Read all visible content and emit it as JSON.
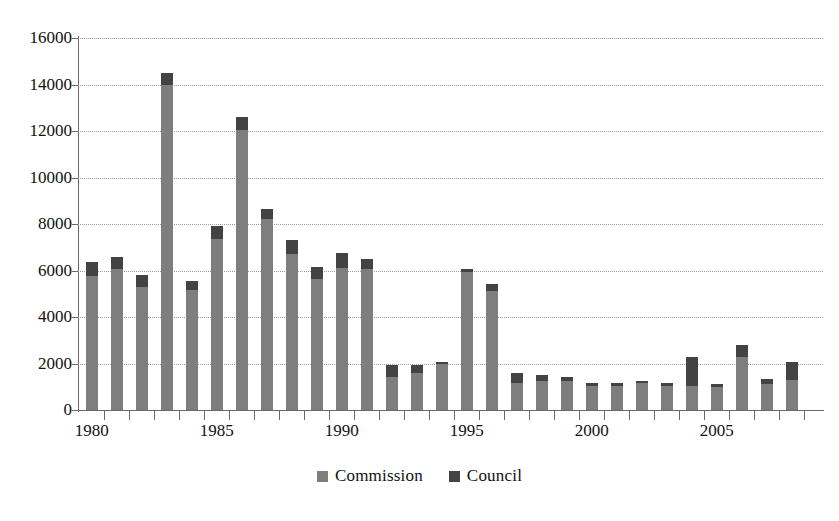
{
  "chart_data": {
    "type": "bar",
    "subtype": "stacked-vertical",
    "title": "",
    "subtitle": "",
    "xlabel": "",
    "ylabel": "",
    "ylim": [
      0,
      16000
    ],
    "ytick_step": 2000,
    "ytick_labels": [
      "0",
      "2000",
      "4000",
      "6000",
      "8000",
      "10000",
      "12000",
      "14000",
      "16000"
    ],
    "grid": "horizontal-dotted",
    "legend_position": "bottom-center",
    "legend": [
      "Commission",
      "Council"
    ],
    "xtick_labels": [
      "1980",
      "1985",
      "1990",
      "1995",
      "2000",
      "2005"
    ],
    "xtick_label_years": [
      1980,
      1985,
      1990,
      1995,
      2000,
      2005
    ],
    "categories": [
      "1980",
      "1981",
      "1982",
      "1983",
      "1984",
      "1985",
      "1986",
      "1987",
      "1988",
      "1989",
      "1990",
      "1991",
      "1992",
      "1993",
      "1994",
      "1995",
      "1996",
      "1997",
      "1998",
      "1999",
      "2000",
      "2001",
      "2002",
      "2003",
      "2004",
      "2005",
      "2006",
      "2007",
      "2008"
    ],
    "series": [
      {
        "name": "Commission",
        "color": "#7e7e7e",
        "values": [
          5750,
          6050,
          5300,
          14000,
          5150,
          7350,
          12050,
          8200,
          6700,
          5650,
          6100,
          6050,
          1400,
          1600,
          2000,
          5950,
          5100,
          1150,
          1250,
          1250,
          1050,
          1050,
          1150,
          1050,
          1050,
          1000,
          2300,
          1100,
          1300
        ]
      },
      {
        "name": "Council",
        "color": "#434343",
        "values": [
          600,
          550,
          500,
          500,
          400,
          550,
          550,
          450,
          600,
          500,
          650,
          450,
          550,
          350,
          50,
          100,
          300,
          450,
          250,
          150,
          100,
          100,
          100,
          100,
          1250,
          100,
          500,
          250,
          750
        ]
      }
    ],
    "totals": [
      6350,
      6600,
      5800,
      14500,
      5550,
      7900,
      12600,
      8650,
      7300,
      6150,
      6750,
      6500,
      1950,
      1950,
      2050,
      6050,
      5400,
      1600,
      1500,
      1400,
      1150,
      1150,
      1250,
      1150,
      2300,
      1100,
      2800,
      1350,
      2050
    ]
  },
  "legend": {
    "items": [
      {
        "label": "Commission",
        "color": "#7e7e7e"
      },
      {
        "label": "Council",
        "color": "#434343"
      }
    ]
  }
}
